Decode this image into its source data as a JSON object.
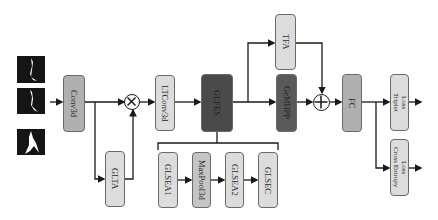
{
  "diagram": {
    "input": {
      "frames": [
        "silhouette-frame-1",
        "silhouette-frame-2",
        "silhouette-frame-3"
      ]
    },
    "nodes": {
      "conv3d": "Conv3d",
      "glta": "GLTA",
      "multiply_op": "⊗",
      "ltconv3d": "LTConv3d",
      "glfes": "GLFES",
      "tfa": "TFA",
      "gemhpp": "GeMHPP",
      "add_op": "⊕",
      "fc": "FC",
      "triplet_loss": [
        "Triplet",
        "Loss"
      ],
      "cross_entropy_loss": [
        "Cross Entropy",
        "Loss"
      ]
    },
    "glfes_components": [
      "GLSEA1",
      "MaxPool3d",
      "GLSEA2",
      "GLSEC"
    ],
    "edges": [
      [
        "input",
        "conv3d"
      ],
      [
        "conv3d",
        "multiply_op"
      ],
      [
        "conv3d",
        "glta"
      ],
      [
        "glta",
        "multiply_op"
      ],
      [
        "multiply_op",
        "ltconv3d"
      ],
      [
        "ltconv3d",
        "glfes"
      ],
      [
        "glfes",
        "gemhpp"
      ],
      [
        "glfes",
        "tfa"
      ],
      [
        "gemhpp",
        "add_op"
      ],
      [
        "tfa",
        "add_op"
      ],
      [
        "add_op",
        "fc"
      ],
      [
        "fc",
        "triplet_loss"
      ],
      [
        "fc",
        "cross_entropy_loss"
      ],
      [
        "GLSEA1",
        "MaxPool3d"
      ],
      [
        "MaxPool3d",
        "GLSEA2"
      ],
      [
        "GLSEA2",
        "GLSEC"
      ]
    ],
    "colors": {
      "light": "#dcdcdc",
      "mid": "#b0b0b0",
      "dark": "#5a5a5a",
      "line": "#1a1a1a"
    }
  }
}
